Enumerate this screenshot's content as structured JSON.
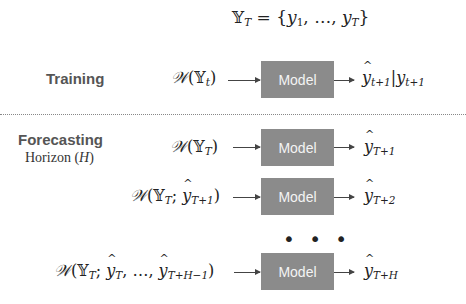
{
  "header": {
    "set_definition": "𝕐_T = {y_1, …, y_T}"
  },
  "training": {
    "label": "Training",
    "input": "𝒲(𝕐_t)",
    "model_label": "Model",
    "output": "ŷ_{t+1} | y_{t+1}"
  },
  "forecasting": {
    "label": "Forecasting",
    "sublabel": "Horizon (H)",
    "steps": [
      {
        "input": "𝒲(𝕐_T)",
        "model_label": "Model",
        "output": "ŷ_{T+1}"
      },
      {
        "input": "𝒲(𝕐_T; ŷ_{T+1})",
        "model_label": "Model",
        "output": "ŷ_{T+2}"
      },
      {
        "input": "𝒲(𝕐_T; ŷ_T, …, ŷ_{T+H−1})",
        "model_label": "Model",
        "output": "ŷ_{T+H}"
      }
    ],
    "ellipsis": "• • •"
  },
  "colors": {
    "model_box": "#8b8b8b",
    "model_text": "#f4f4f4",
    "label_text": "#555555",
    "divider": "#888888"
  }
}
